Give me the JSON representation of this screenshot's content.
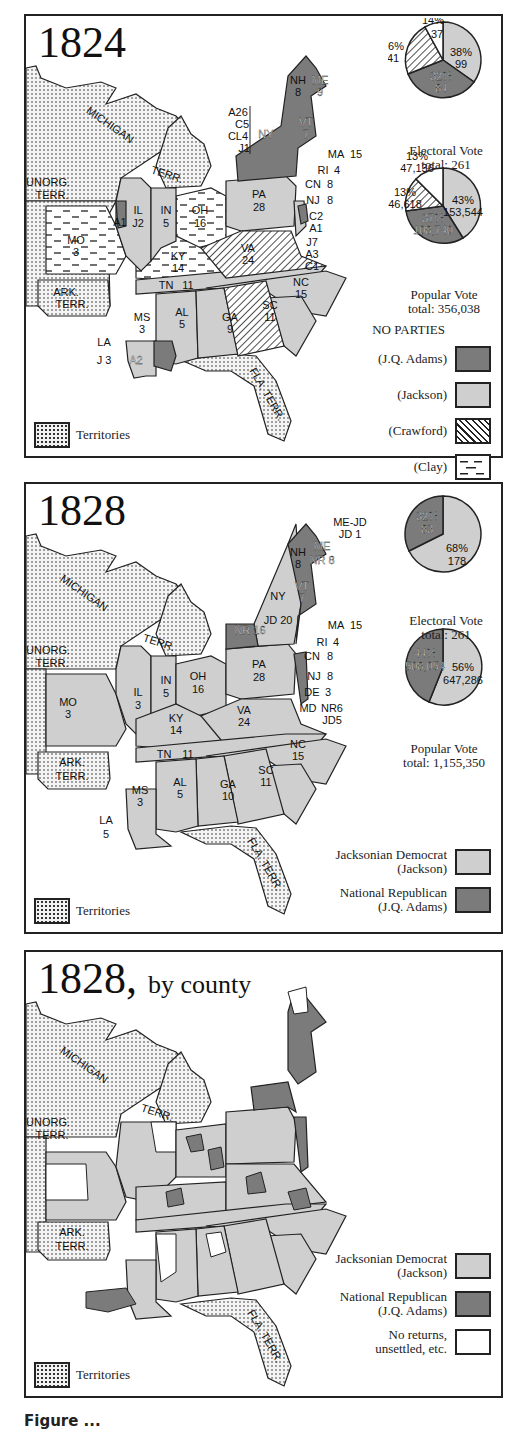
{
  "panels": [
    {
      "year": "1824",
      "subtitle": "",
      "states": [
        {
          "abbr": "NH",
          "ev": "8"
        },
        {
          "abbr": "ME",
          "ev": "9"
        },
        {
          "abbr": "VT",
          "ev": "7"
        },
        {
          "abbr": "NY",
          "ev": ""
        },
        {
          "abbr": "MA",
          "ev": "15"
        },
        {
          "abbr": "RI",
          "ev": "4"
        },
        {
          "abbr": "CN",
          "ev": "8"
        },
        {
          "abbr": "NJ",
          "ev": "8"
        },
        {
          "abbr": "PA",
          "ev": "28"
        },
        {
          "abbr": "IL",
          "ev": "J2"
        },
        {
          "abbr": "IN",
          "ev": "5"
        },
        {
          "abbr": "OH",
          "ev": "16"
        },
        {
          "abbr": "MO",
          "ev": "3"
        },
        {
          "abbr": "KY",
          "ev": "14"
        },
        {
          "abbr": "VA",
          "ev": "24"
        },
        {
          "abbr": "NC",
          "ev": "15"
        },
        {
          "abbr": "TN",
          "ev": "11"
        },
        {
          "abbr": "SC",
          "ev": "11"
        },
        {
          "abbr": "GA",
          "ev": "9"
        },
        {
          "abbr": "AL",
          "ev": "5"
        },
        {
          "abbr": "MS",
          "ev": "3"
        },
        {
          "abbr": "LA",
          "ev": "J 3"
        },
        {
          "abbr": "LA-A",
          "ev": "A2"
        },
        {
          "abbr": "IL-A",
          "ev": "A1"
        }
      ],
      "ny_split": [
        "A26",
        "C5",
        "CL4",
        "J1"
      ],
      "de_split": [
        "C2",
        "A1"
      ],
      "md_split": [
        "J7",
        "A3",
        "C1"
      ],
      "territories": [
        "MICHIGAN",
        "TERR.",
        "UNORG.",
        "TERR.",
        "ARK.",
        "TERR.",
        "FLA. TERR."
      ],
      "electoral": {
        "caption_1": "Electoral Vote",
        "caption_2": "total: 261",
        "slices": [
          {
            "candidate": "Jackson",
            "pct": "38%",
            "value": "99"
          },
          {
            "candidate": "J.Q. Adams",
            "pct": "32%",
            "value": "84"
          },
          {
            "candidate": "Crawford",
            "pct": "16%",
            "value": "41"
          },
          {
            "candidate": "Clay",
            "pct": "14%",
            "value": "37"
          }
        ]
      },
      "popular": {
        "caption_1": "Popular Vote",
        "caption_2": "total: 356,038",
        "slices": [
          {
            "candidate": "Jackson",
            "pct": "43%",
            "value": "153,544"
          },
          {
            "candidate": "J.Q. Adams",
            "pct": "37%",
            "value": "108,740"
          },
          {
            "candidate": "Crawford",
            "pct": "13%",
            "value": "46,618"
          },
          {
            "candidate": "Clay",
            "pct": "13%",
            "value": "47,136"
          }
        ]
      },
      "legend_title": "NO PARTIES",
      "legend": [
        "(J.Q. Adams)",
        "(Jackson)",
        "(Crawford)",
        "(Clay)"
      ],
      "territories_key": "Territories"
    },
    {
      "year": "1828",
      "subtitle": "",
      "states": [
        {
          "abbr": "NH",
          "ev": "8"
        },
        {
          "abbr": "ME",
          "ev": "NR 8"
        },
        {
          "abbr": "ME-JD",
          "ev": "JD 1"
        },
        {
          "abbr": "VT",
          "ev": "7"
        },
        {
          "abbr": "NY-NR",
          "ev": "NR 16"
        },
        {
          "abbr": "NY-JD",
          "ev": "JD 20"
        },
        {
          "abbr": "MA",
          "ev": "15"
        },
        {
          "abbr": "RI",
          "ev": "4"
        },
        {
          "abbr": "CN",
          "ev": "8"
        },
        {
          "abbr": "NJ",
          "ev": "8"
        },
        {
          "abbr": "DE",
          "ev": "3"
        },
        {
          "abbr": "PA",
          "ev": "28"
        },
        {
          "abbr": "IL",
          "ev": "3"
        },
        {
          "abbr": "IN",
          "ev": "5"
        },
        {
          "abbr": "OH",
          "ev": "16"
        },
        {
          "abbr": "MO",
          "ev": "3"
        },
        {
          "abbr": "KY",
          "ev": "14"
        },
        {
          "abbr": "VA",
          "ev": "24"
        },
        {
          "abbr": "NC",
          "ev": "15"
        },
        {
          "abbr": "TN",
          "ev": "11"
        },
        {
          "abbr": "SC",
          "ev": "11"
        },
        {
          "abbr": "GA",
          "ev": "10"
        },
        {
          "abbr": "AL",
          "ev": "5"
        },
        {
          "abbr": "MS",
          "ev": "3"
        },
        {
          "abbr": "LA",
          "ev": "5"
        }
      ],
      "md_split": [
        "NR6",
        "JD5"
      ],
      "electoral": {
        "caption_1": "Electoral Vote",
        "caption_2": "total: 261",
        "slices": [
          {
            "candidate": "Jackson",
            "pct": "68%",
            "value": "178"
          },
          {
            "candidate": "J.Q. Adams",
            "pct": "32%",
            "value": "83"
          }
        ]
      },
      "popular": {
        "caption_1": "Popular Vote",
        "caption_2": "total: 1,155,350",
        "slices": [
          {
            "candidate": "Jackson",
            "pct": "56%",
            "value": "647,286"
          },
          {
            "candidate": "J.Q. Adams",
            "pct": "44%",
            "value": "508,054"
          }
        ]
      },
      "legend": [
        {
          "line1": "Jacksonian Democrat",
          "line2": "(Jackson)"
        },
        {
          "line1": "National Republican",
          "line2": "(J.Q. Adams)"
        }
      ],
      "territories_key": "Territories"
    },
    {
      "year": "1828,",
      "subtitle": "by county",
      "legend": [
        {
          "line1": "Jacksonian Democrat",
          "line2": "(Jackson)"
        },
        {
          "line1": "National Republican",
          "line2": "(J.Q. Adams)"
        },
        {
          "line1": "No returns,",
          "line2": "unsettled, etc."
        }
      ],
      "territories_key": "Territories"
    }
  ],
  "colors": {
    "adams": "#7b7b7b",
    "jackson": "#cfcfcf",
    "territory": "#f2f2f2",
    "frame": "#222222"
  },
  "footer_caption": "Figure ..."
}
